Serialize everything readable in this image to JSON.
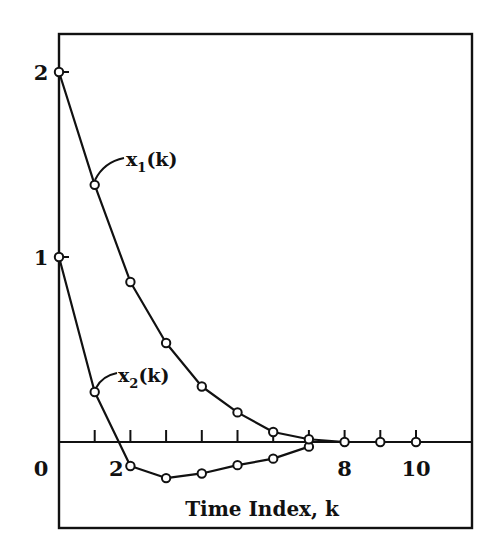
{
  "chart_data": {
    "type": "line",
    "title": "",
    "xlabel": "Time Index, k",
    "ylabel": "",
    "xlim": [
      0,
      11.7
    ],
    "ylim": [
      -0.47,
      2.2
    ],
    "grid": false,
    "legend": "inline labels",
    "x_ticks": [
      1,
      2,
      3,
      4,
      5,
      6,
      7,
      8,
      9,
      10
    ],
    "x_tick_labels": [
      {
        "value": 2,
        "label": "2"
      },
      {
        "value": 8,
        "label": "8"
      },
      {
        "value": 10,
        "label": "10"
      }
    ],
    "y_ticks": [
      0,
      1,
      2
    ],
    "y_tick_labels": [
      {
        "value": 0,
        "label": "0"
      },
      {
        "value": 1,
        "label": "1"
      },
      {
        "value": 2,
        "label": "2"
      }
    ],
    "series": [
      {
        "name": "x1(k)",
        "label_main": "x",
        "label_sub": "1",
        "label_tail": "(k)",
        "marker": "open-circle",
        "x": [
          0,
          1,
          2,
          3,
          4,
          5,
          6,
          7,
          8,
          9,
          10
        ],
        "values": [
          2.0,
          1.39,
          0.865,
          0.535,
          0.3,
          0.16,
          0.054,
          0.015,
          0.0,
          0.0,
          0.0
        ]
      },
      {
        "name": "x2(k)",
        "label_main": "x",
        "label_sub": "2",
        "label_tail": "(k)",
        "marker": "open-circle",
        "x": [
          0,
          1,
          2,
          3,
          4,
          5,
          6,
          7
        ],
        "values": [
          1.0,
          0.27,
          -0.13,
          -0.195,
          -0.17,
          -0.125,
          -0.09,
          -0.025
        ]
      }
    ]
  }
}
